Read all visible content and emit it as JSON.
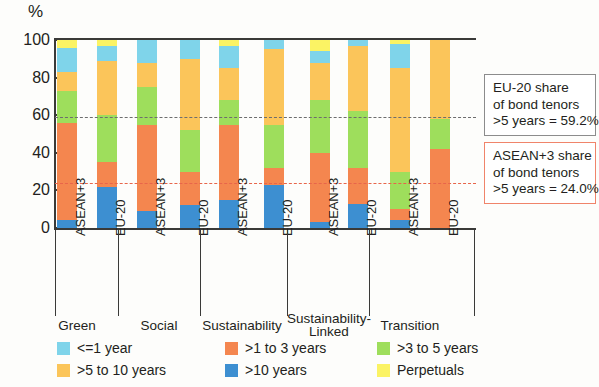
{
  "axis": {
    "y_unit": "%",
    "y_ticks": [
      "100",
      "80",
      "60",
      "40",
      "20",
      "0"
    ],
    "y_tick_values": [
      100,
      80,
      60,
      40,
      20,
      0
    ],
    "ylim": [
      0,
      100
    ]
  },
  "groups": [
    {
      "label": "Green",
      "members": [
        "ASEAN+3",
        "EU-20"
      ]
    },
    {
      "label": "Social",
      "members": [
        "ASEAN+3",
        "EU-20"
      ]
    },
    {
      "label": "Sustainability",
      "members": [
        "ASEAN+3",
        "EU-20"
      ]
    },
    {
      "label_line1": "Sustainability-",
      "label_line2": "Linked",
      "label": "Sustainability-Linked",
      "members": [
        "ASEAN+3",
        "EU-20"
      ]
    },
    {
      "label": "Transition",
      "members": [
        "ASEAN+3",
        "EU-20"
      ]
    }
  ],
  "reference_lines": [
    {
      "name": "eu20",
      "value": 59.2,
      "color": "#6d6d6d"
    },
    {
      "name": "asean3",
      "value": 24.0,
      "color": "#e8654a"
    }
  ],
  "callouts": [
    {
      "name": "eu20",
      "line1": "EU-20 share",
      "line2": "of bond tenors",
      "line3": ">5 years = 59.2%",
      "border_color": "#8c8c8c"
    },
    {
      "name": "asean3",
      "line1": "ASEAN+3 share",
      "line2": "of bond tenors",
      "line3": ">5 years = 24.0%",
      "border_color": "#f0846a"
    }
  ],
  "legend": [
    {
      "label": "<=1 year",
      "color": "#7fd4ea"
    },
    {
      "label": ">1 to 3 years",
      "color": "#f4864f"
    },
    {
      "label": ">3 to 5 years",
      "color": "#9ede5c"
    },
    {
      "label": ">5 to 10 years",
      "color": "#fbc martins"
    },
    {
      "label": ">10 years",
      "color": "#3d8fd1"
    },
    {
      "label": "Perpetuals",
      "color": "#fbf364"
    }
  ],
  "chart_data": {
    "type": "bar",
    "stacked": true,
    "title": "",
    "xlabel": "",
    "ylabel": "%",
    "ylim": [
      0,
      100
    ],
    "grid": false,
    "legend_position": "bottom",
    "categories": [
      "Green / ASEAN+3",
      "Green / EU-20",
      "Social / ASEAN+3",
      "Social / EU-20",
      "Sustainability / ASEAN+3",
      "Sustainability / EU-20",
      "Sustainability-Linked / ASEAN+3",
      "Sustainability-Linked / EU-20",
      "Transition / ASEAN+3",
      "Transition / EU-20"
    ],
    "series": [
      {
        "name": "<=1 year",
        "color": "#7fd4ea",
        "values": [
          13,
          8,
          12,
          10,
          12,
          5,
          6,
          3,
          13,
          0
        ]
      },
      {
        "name": ">1 to 3 years",
        "color": "#f4864f",
        "values": [
          52,
          13,
          46,
          18,
          40,
          9,
          37,
          19,
          6,
          42
        ]
      },
      {
        "name": ">3 to 5 years",
        "color": "#9ede5c",
        "values": [
          17,
          25,
          20,
          22,
          13,
          23,
          28,
          30,
          20,
          16
        ]
      },
      {
        "name": ">5 to 10 years",
        "color": "#fbc55a",
        "values": [
          10,
          29,
          13,
          38,
          17,
          40,
          20,
          35,
          55,
          42
        ]
      },
      {
        "name": ">10 years",
        "color": "#3d8fd1",
        "values": [
          4,
          22,
          9,
          12,
          15,
          23,
          3,
          13,
          4,
          0
        ]
      },
      {
        "name": "Perpetuals",
        "color": "#fbf364",
        "values": [
          4,
          3,
          0,
          0,
          3,
          0,
          6,
          0,
          2,
          0
        ]
      }
    ],
    "stack_order": [
      "> 10 years",
      ">1 to 3 years",
      ">3 to 5 years",
      ">5 to 10 years",
      "<=1 year",
      "Perpetuals"
    ],
    "annotations": [
      {
        "text": "EU-20 share of bond tenors >5 years = 59.2%",
        "value": 59.2
      },
      {
        "text": "ASEAN+3 share of bond tenors >5 years = 24.0%",
        "value": 24.0
      }
    ]
  },
  "bar_stacks": [
    {
      "group": 0,
      "member": 0,
      "segments": [
        {
          "series": 4,
          "from": 0,
          "to": 4
        },
        {
          "series": 1,
          "from": 4,
          "to": 56
        },
        {
          "series": 2,
          "from": 56,
          "to": 73
        },
        {
          "series": 3,
          "from": 73,
          "to": 83
        },
        {
          "series": 0,
          "from": 83,
          "to": 96
        },
        {
          "series": 5,
          "from": 96,
          "to": 100
        }
      ]
    },
    {
      "group": 0,
      "member": 1,
      "segments": [
        {
          "series": 4,
          "from": 0,
          "to": 22
        },
        {
          "series": 1,
          "from": 22,
          "to": 35
        },
        {
          "series": 2,
          "from": 35,
          "to": 60
        },
        {
          "series": 3,
          "from": 60,
          "to": 89
        },
        {
          "series": 0,
          "from": 89,
          "to": 97
        },
        {
          "series": 5,
          "from": 97,
          "to": 100
        }
      ]
    },
    {
      "group": 1,
      "member": 0,
      "segments": [
        {
          "series": 4,
          "from": 0,
          "to": 9
        },
        {
          "series": 1,
          "from": 9,
          "to": 55
        },
        {
          "series": 2,
          "from": 55,
          "to": 75
        },
        {
          "series": 3,
          "from": 75,
          "to": 88
        },
        {
          "series": 0,
          "from": 88,
          "to": 100
        }
      ]
    },
    {
      "group": 1,
      "member": 1,
      "segments": [
        {
          "series": 4,
          "from": 0,
          "to": 12
        },
        {
          "series": 1,
          "from": 12,
          "to": 30
        },
        {
          "series": 2,
          "from": 30,
          "to": 52
        },
        {
          "series": 3,
          "from": 52,
          "to": 90
        },
        {
          "series": 0,
          "from": 90,
          "to": 100
        }
      ]
    },
    {
      "group": 2,
      "member": 0,
      "segments": [
        {
          "series": 4,
          "from": 0,
          "to": 15
        },
        {
          "series": 1,
          "from": 15,
          "to": 55
        },
        {
          "series": 2,
          "from": 55,
          "to": 68
        },
        {
          "series": 3,
          "from": 68,
          "to": 85
        },
        {
          "series": 0,
          "from": 85,
          "to": 97
        },
        {
          "series": 5,
          "from": 97,
          "to": 100
        }
      ]
    },
    {
      "group": 2,
      "member": 1,
      "segments": [
        {
          "series": 4,
          "from": 0,
          "to": 23
        },
        {
          "series": 1,
          "from": 23,
          "to": 32
        },
        {
          "series": 2,
          "from": 32,
          "to": 55
        },
        {
          "series": 3,
          "from": 55,
          "to": 95
        },
        {
          "series": 0,
          "from": 95,
          "to": 100
        }
      ]
    },
    {
      "group": 3,
      "member": 0,
      "segments": [
        {
          "series": 4,
          "from": 0,
          "to": 3
        },
        {
          "series": 1,
          "from": 3,
          "to": 40
        },
        {
          "series": 2,
          "from": 40,
          "to": 68
        },
        {
          "series": 3,
          "from": 68,
          "to": 88
        },
        {
          "series": 0,
          "from": 88,
          "to": 94
        },
        {
          "series": 5,
          "from": 94,
          "to": 100
        }
      ]
    },
    {
      "group": 3,
      "member": 1,
      "segments": [
        {
          "series": 4,
          "from": 0,
          "to": 13
        },
        {
          "series": 1,
          "from": 13,
          "to": 32
        },
        {
          "series": 2,
          "from": 32,
          "to": 62
        },
        {
          "series": 3,
          "from": 62,
          "to": 97
        },
        {
          "series": 0,
          "from": 97,
          "to": 100
        }
      ]
    },
    {
      "group": 4,
      "member": 0,
      "segments": [
        {
          "series": 4,
          "from": 0,
          "to": 4
        },
        {
          "series": 1,
          "from": 4,
          "to": 10
        },
        {
          "series": 2,
          "from": 10,
          "to": 30
        },
        {
          "series": 3,
          "from": 30,
          "to": 85
        },
        {
          "series": 0,
          "from": 85,
          "to": 98
        },
        {
          "series": 5,
          "from": 98,
          "to": 100
        }
      ]
    },
    {
      "group": 4,
      "member": 1,
      "segments": [
        {
          "series": 1,
          "from": 0,
          "to": 42
        },
        {
          "series": 2,
          "from": 42,
          "to": 58
        },
        {
          "series": 3,
          "from": 58,
          "to": 100
        }
      ]
    }
  ]
}
